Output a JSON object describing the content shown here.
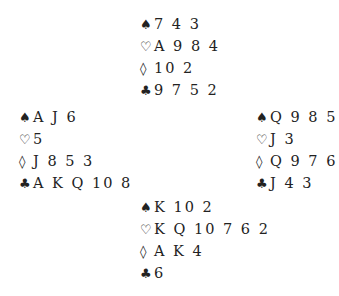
{
  "deal": {
    "north": {
      "spades": "7 4 3",
      "hearts": "A 9 8 4",
      "diamonds": "10 2",
      "clubs": "9 7 5 2"
    },
    "west": {
      "spades": "A J 6",
      "hearts": "5",
      "diamonds": "J 8 5 3",
      "clubs": "A K Q 10 8"
    },
    "east": {
      "spades": "Q 9 8 5",
      "hearts": "J 3",
      "diamonds": "Q 9 7 6",
      "clubs": "J 4 3"
    },
    "south": {
      "spades": "K 10 2",
      "hearts": "K Q 10 7 6 2",
      "diamonds": "A K 4",
      "clubs": "6"
    }
  },
  "suits": {
    "spades": "♠",
    "hearts": "♡",
    "diamonds": "◊",
    "clubs": "♣"
  }
}
